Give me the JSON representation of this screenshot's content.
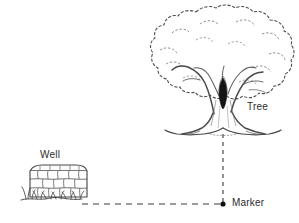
{
  "scene": {
    "title": "Well, Tree and Marker sketch diagram",
    "background_color": "#ffffff",
    "ink_color": "#3a3a3a",
    "width": 299,
    "height": 223
  },
  "labels": {
    "well": "Well",
    "tree": "Tree",
    "marker": "Marker"
  },
  "objects": {
    "well": {
      "name": "Well",
      "description": "stone masonry well with capstone rim and grass tufts at base",
      "x": 27,
      "y": 164,
      "width": 62,
      "height": 36
    },
    "tree": {
      "name": "Tree",
      "description": "broad leafy tree with cloud-like canopy, split trunk with dark hollow and flared roots",
      "x": 152,
      "y": 6,
      "width": 143,
      "height": 132
    },
    "marker": {
      "name": "Marker",
      "description": "solid black dot where the two measurement lines meet",
      "x": 223,
      "y": 204,
      "radius": 2.6,
      "color": "#111111"
    }
  },
  "measurement_lines": [
    {
      "name": "well-to-marker",
      "orientation": "horizontal",
      "from_x": 82,
      "from_y": 204,
      "to_x": 223,
      "to_y": 204,
      "style": "dashed"
    },
    {
      "name": "tree-to-marker",
      "orientation": "vertical",
      "from_x": 223,
      "from_y": 134,
      "to_x": 223,
      "to_y": 204,
      "style": "dashed"
    }
  ]
}
